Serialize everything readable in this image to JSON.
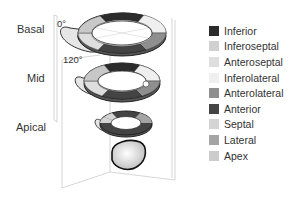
{
  "levels": {
    "basal": "Basal",
    "mid": "Mid",
    "apical": "Apical"
  },
  "angles": {
    "a0": "0°",
    "a120": "120°"
  },
  "legend": [
    {
      "label": "Inferior",
      "color": "#2b2b2b"
    },
    {
      "label": "Inferoseptal",
      "color": "#d0d0d0"
    },
    {
      "label": "Anteroseptal",
      "color": "#dedede"
    },
    {
      "label": "Inferolateral",
      "color": "#efefef"
    },
    {
      "label": "Anterolateral",
      "color": "#8f8f8f"
    },
    {
      "label": "Anterior",
      "color": "#444444"
    },
    {
      "label": "Septal",
      "color": "#d4d4d4"
    },
    {
      "label": "Lateral",
      "color": "#a4a4a4"
    },
    {
      "label": "Apex",
      "color": "#cccccc"
    }
  ]
}
